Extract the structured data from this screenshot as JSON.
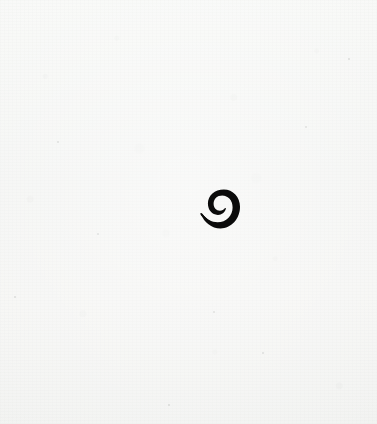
{
  "document": {
    "kind": "scanned-page",
    "page_width": 377,
    "page_height": 424,
    "background_color": "#f4f5f3",
    "paper_tone": "off-white textured paper",
    "visible_text": "",
    "caption": ""
  },
  "glyph": {
    "name": "spiral-comma-glyph",
    "description": "single small black spiral mark resembling a stylized nine or ensō swirl",
    "ink_color": "#0b0b0b",
    "center_x": 221,
    "center_y": 209,
    "width": 38,
    "height": 39,
    "label": ""
  },
  "artifacts": {
    "specks": [
      {
        "x": 97,
        "y": 233,
        "size": 2
      },
      {
        "x": 14,
        "y": 296,
        "size": 2
      },
      {
        "x": 305,
        "y": 126,
        "size": 2
      },
      {
        "x": 262,
        "y": 352,
        "size": 2
      },
      {
        "x": 168,
        "y": 404,
        "size": 2
      },
      {
        "x": 348,
        "y": 58,
        "size": 2
      },
      {
        "x": 57,
        "y": 141,
        "size": 2
      },
      {
        "x": 213,
        "y": 311,
        "size": 2
      }
    ]
  }
}
